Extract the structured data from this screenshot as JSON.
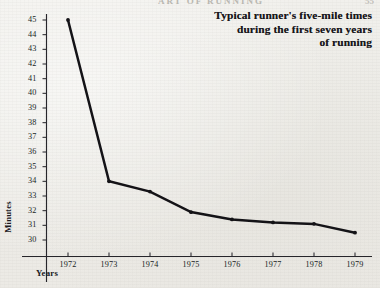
{
  "page": {
    "running_head": "ART OF RUNNING",
    "page_number": "55"
  },
  "title": {
    "line1": "Typical runner's five-mile times",
    "line2": "during the first seven years",
    "line3": "of running"
  },
  "axes": {
    "y_title": "Minutes",
    "x_title": "Years"
  },
  "chart_data": {
    "type": "line",
    "title": "Typical runner's five-mile times during the first seven years of running",
    "xlabel": "Years",
    "ylabel": "Minutes",
    "categories": [
      "1972",
      "1973",
      "1974",
      "1975",
      "1976",
      "1977",
      "1978",
      "1979"
    ],
    "x": [
      1972,
      1973,
      1974,
      1975,
      1976,
      1977,
      1978,
      1979
    ],
    "values": [
      45.0,
      34.0,
      33.3,
      31.9,
      31.4,
      31.2,
      31.1,
      30.5
    ],
    "series": [
      {
        "name": "Five-mile time",
        "values": [
          45.0,
          34.0,
          33.3,
          31.9,
          31.4,
          31.2,
          31.1,
          30.5
        ]
      }
    ],
    "ylim": [
      30,
      45
    ],
    "yticks": [
      30,
      31,
      32,
      33,
      34,
      35,
      36,
      37,
      38,
      39,
      40,
      41,
      42,
      43,
      44,
      45
    ],
    "ytick_labels": [
      "30",
      "31",
      "32",
      "33",
      "34",
      "35",
      "36",
      "37",
      "38",
      "39",
      "40",
      "41",
      "42",
      "43",
      "44",
      "45"
    ],
    "xtick_labels": [
      "1972",
      "1973",
      "1974",
      "1975",
      "1976",
      "1977",
      "1978",
      "1979"
    ],
    "grid": false,
    "legend": "none",
    "line_color": "#141317",
    "background_color": "#efeeea"
  }
}
